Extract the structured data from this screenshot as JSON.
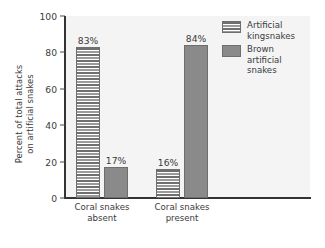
{
  "chart_data": {
    "type": "bar",
    "title": "",
    "subtitle": "",
    "xlabel": "",
    "ylabel": "Percent of total attacks\non artificial snakes",
    "ylim": [
      0,
      100
    ],
    "yticks": [
      0,
      20,
      40,
      60,
      80,
      100
    ],
    "ytick_labels": [
      "0",
      "20",
      "40",
      "60",
      "80",
      "100"
    ],
    "grid": false,
    "legend_position": "top-right",
    "categories": [
      "Coral snakes\nabsent",
      "Coral snakes\npresent"
    ],
    "series": [
      {
        "name": "Artificial\nkingsnakes",
        "fill": "striped",
        "values": [
          83,
          16
        ],
        "value_labels": [
          "83%",
          "16%"
        ]
      },
      {
        "name": "Brown\nartificial\nsnakes",
        "fill": "solid",
        "values": [
          17,
          84
        ],
        "value_labels": [
          "17%",
          "84%"
        ]
      }
    ],
    "colors": {
      "solid_bar": "#8a8a8a",
      "stripe_dark": "#6f6f6f",
      "stripe_light": "#9a9a9a",
      "bar_border": "#6e6e6e",
      "axis": "#333333",
      "text": "#3a3a3a",
      "plot_background": "#f4f4f4",
      "page_background": "#ffffff"
    }
  },
  "axis": {
    "y_title": "Percent of total attacks\non artificial snakes",
    "ticks": [
      {
        "label": "100"
      },
      {
        "label": "80"
      },
      {
        "label": "60"
      },
      {
        "label": "40"
      },
      {
        "label": "20"
      },
      {
        "label": "0"
      }
    ]
  },
  "groups": [
    {
      "label": "Coral snakes\nabsent",
      "bars": [
        {
          "value_label": "83%"
        },
        {
          "value_label": "17%"
        }
      ]
    },
    {
      "label": "Coral snakes\npresent",
      "bars": [
        {
          "value_label": "16%"
        },
        {
          "value_label": "84%"
        }
      ]
    }
  ],
  "legend": {
    "entries": [
      {
        "label": "Artificial\nkingsnakes"
      },
      {
        "label": "Brown\nartificial\nsnakes"
      }
    ]
  }
}
